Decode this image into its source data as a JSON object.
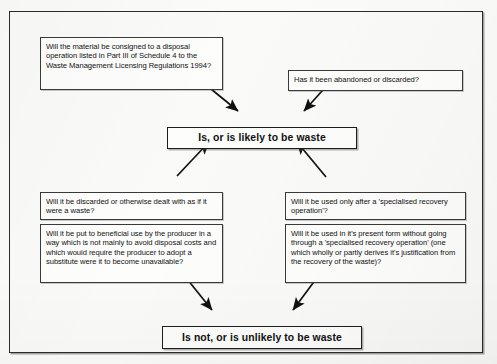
{
  "diagram": {
    "background_color": "#fbfbfa",
    "frame_color": "#2b2b2b",
    "box_fill": "#fdfdfc",
    "text_color": "#111111",
    "nodes": {
      "disposal_operation": "Will the material be consigned to a disposal operation listed in Part III of Schedule 4 to the Waste Management Licensing Regulations 1994?",
      "abandoned": "Has it been abandoned or discarded?",
      "is_waste": "Is, or is likely to be waste",
      "discarded_dealt_with": "Will it be discarded or otherwise dealt with as if it were a waste?",
      "beneficial_use": "Will it be put to beneficial use by the producer in a way which is not mainly to avoid disposal costs and which would require the producer to adopt a substitute were it to become unavailable?",
      "specialised_recovery_only": "Will it be used only after a 'specialised recovery operation'?",
      "present_form": "Will it be used in it's present form without going through a 'specialised recovery operation' (one which wholly or partly derives it's justification from the recovery of the waste)?",
      "is_not_waste": "Is not, or is unlikely to be waste"
    },
    "arrows": [
      {
        "name": "disposal-operation-to-is-waste",
        "from": "disposal_operation",
        "to": "is_waste",
        "x1": 200,
        "y1": 80,
        "x2": 239,
        "y2": 112
      },
      {
        "name": "abandoned-to-is-waste",
        "from": "abandoned",
        "to": "is_waste",
        "x1": 330,
        "y1": 81,
        "x2": 303,
        "y2": 112
      },
      {
        "name": "discarded-dealt-with-to-is-waste",
        "from": "discarded_dealt_with",
        "to": "is_waste",
        "x1": 177,
        "y1": 175,
        "x2": 209,
        "y2": 141
      },
      {
        "name": "specialised-recovery-only-to-is-waste",
        "from": "specialised_recovery_only",
        "to": "is_waste",
        "x1": 325,
        "y1": 176,
        "x2": 296,
        "y2": 141
      },
      {
        "name": "beneficial-use-to-is-not-waste",
        "from": "beneficial_use",
        "to": "is_not_waste",
        "x1": 183,
        "y1": 275,
        "x2": 212,
        "y2": 310
      },
      {
        "name": "present-form-to-is-not-waste",
        "from": "present_form",
        "to": "is_not_waste",
        "x1": 318,
        "y1": 276,
        "x2": 293,
        "y2": 310
      }
    ]
  }
}
